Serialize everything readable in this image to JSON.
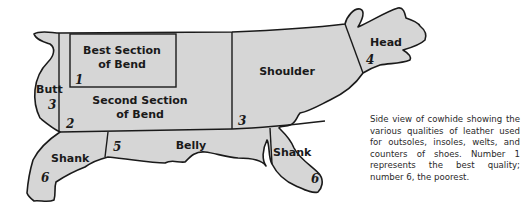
{
  "diagram": {
    "title": "Side view of cowhide",
    "fill_color": "#d6d6d6",
    "outline_color": "#1a1a1a",
    "regions": [
      {
        "id": "best-section",
        "label_line1": "Best Section",
        "label_line2": "of Bend",
        "quality": "1"
      },
      {
        "id": "second-section",
        "label_line1": "Second Section",
        "label_line2": "of Bend",
        "quality": "2"
      },
      {
        "id": "butt",
        "label": "Butt",
        "quality": "3"
      },
      {
        "id": "shoulder",
        "label": "Shoulder",
        "quality": "3"
      },
      {
        "id": "head",
        "label": "Head",
        "quality": "4"
      },
      {
        "id": "belly",
        "label": "Belly",
        "quality": "5"
      },
      {
        "id": "hind-shank",
        "label": "Shank",
        "quality": "6"
      },
      {
        "id": "fore-shank",
        "label": "Shank",
        "quality": "6"
      }
    ]
  },
  "caption": {
    "text": "Side view of cowhide showing the various qualities of leather used for outsoles, insoles, welts, and counters of shoes. Number 1 represents the best quality; number 6, the poorest."
  }
}
